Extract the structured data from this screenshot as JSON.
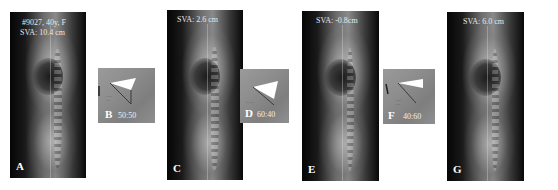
{
  "figure": {
    "panels": [
      {
        "id": "A",
        "letter": "A",
        "type": "radiograph",
        "header_line1": "#9027, 40y, F",
        "header_line2": "SVA: 10.4 cm"
      },
      {
        "id": "B",
        "letter": "B",
        "type": "wedge-inset",
        "ratio": "50:50"
      },
      {
        "id": "C",
        "letter": "C",
        "type": "radiograph",
        "header_line1": "SVA: 2.6 cm"
      },
      {
        "id": "D",
        "letter": "D",
        "type": "wedge-inset",
        "ratio": "60:40"
      },
      {
        "id": "E",
        "letter": "E",
        "type": "radiograph",
        "header_line1": "SVA: -0.8cm"
      },
      {
        "id": "F",
        "letter": "F",
        "type": "wedge-inset",
        "ratio": "40:60"
      },
      {
        "id": "G",
        "letter": "G",
        "type": "radiograph",
        "header_line1": "SVA: 6.0 cm"
      }
    ],
    "colors": {
      "background": "#ffffff",
      "xray_dark": "#050505",
      "inset_gray": "#8f8f8f",
      "wedge_white": "#ffffff",
      "label_white": "#ffffff"
    }
  }
}
